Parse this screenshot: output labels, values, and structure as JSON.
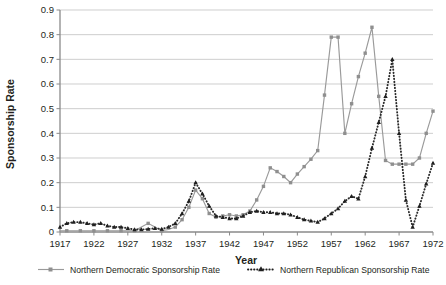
{
  "chart_data": {
    "type": "line",
    "title": "",
    "xlabel": "Year",
    "ylabel": "Sponsorship Rate",
    "xlim": [
      1917,
      1972
    ],
    "ylim": [
      0,
      0.9
    ],
    "grid": "horizontal",
    "legend_position": "bottom",
    "ytick_labels": [
      "0",
      "0.1",
      "0.2",
      "0.3",
      "0.4",
      "0.5",
      "0.6",
      "0.7",
      "0.8",
      "0.9"
    ],
    "yticks": [
      0,
      0.1,
      0.2,
      0.3,
      0.4,
      0.5,
      0.6,
      0.7,
      0.8,
      0.9
    ],
    "xtick_labels": [
      "1917",
      "1922",
      "1927",
      "1932",
      "1937",
      "1942",
      "1947",
      "1952",
      "1957",
      "1962",
      "1967",
      "1972"
    ],
    "xticks": [
      1917,
      1922,
      1927,
      1932,
      1937,
      1942,
      1947,
      1952,
      1957,
      1962,
      1967,
      1972
    ],
    "x": [
      1917,
      1918,
      1919,
      1920,
      1921,
      1922,
      1923,
      1924,
      1925,
      1926,
      1927,
      1928,
      1929,
      1930,
      1931,
      1932,
      1933,
      1934,
      1935,
      1936,
      1937,
      1938,
      1939,
      1940,
      1941,
      1942,
      1943,
      1944,
      1945,
      1946,
      1947,
      1948,
      1949,
      1950,
      1951,
      1952,
      1953,
      1954,
      1955,
      1956,
      1957,
      1958,
      1959,
      1960,
      1961,
      1962,
      1963,
      1964,
      1965,
      1966,
      1967,
      1968,
      1969,
      1970,
      1971,
      1972
    ],
    "series": [
      {
        "name": "Northern Democratic Sponsorship Rate",
        "color": "#9a9a9a",
        "style": "solid",
        "marker": "square",
        "values": [
          0.005,
          0.005,
          0.005,
          0.005,
          0.005,
          0.005,
          0.005,
          0.005,
          0.005,
          0.005,
          0.005,
          0.005,
          0.02,
          0.035,
          0.02,
          0.005,
          0.01,
          0.02,
          0.05,
          0.1,
          0.17,
          0.135,
          0.075,
          0.06,
          0.065,
          0.07,
          0.065,
          0.07,
          0.085,
          0.13,
          0.185,
          0.26,
          0.245,
          0.225,
          0.2,
          0.235,
          0.265,
          0.295,
          0.33,
          0.555,
          0.79,
          0.79,
          0.4,
          0.52,
          0.63,
          0.725,
          0.83,
          0.55,
          0.29,
          0.275,
          0.275,
          0.275,
          0.275,
          0.3,
          0.4,
          0.49
        ]
      },
      {
        "name": "Northern Republican Sponsorship Rate",
        "color": "#1f1f1f",
        "style": "dotted",
        "marker": "triangle",
        "values": [
          0.02,
          0.035,
          0.04,
          0.04,
          0.035,
          0.03,
          0.035,
          0.025,
          0.02,
          0.02,
          0.015,
          0.01,
          0.01,
          0.012,
          0.015,
          0.012,
          0.02,
          0.035,
          0.075,
          0.125,
          0.2,
          0.155,
          0.105,
          0.065,
          0.06,
          0.055,
          0.055,
          0.065,
          0.08,
          0.085,
          0.08,
          0.08,
          0.075,
          0.075,
          0.07,
          0.06,
          0.05,
          0.045,
          0.04,
          0.055,
          0.075,
          0.095,
          0.125,
          0.145,
          0.135,
          0.225,
          0.34,
          0.445,
          0.55,
          0.7,
          0.4,
          0.13,
          0.02,
          0.105,
          0.195,
          0.28
        ]
      }
    ]
  },
  "legend": {
    "items": [
      {
        "label": "Northern Democratic Sponsorship Rate"
      },
      {
        "label": "Northern Republican Sponsorship Rate"
      }
    ]
  }
}
